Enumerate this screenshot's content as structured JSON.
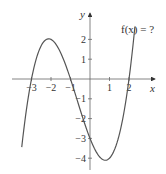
{
  "chart_data": {
    "type": "line",
    "title": "",
    "function_label": "f(x) = ?",
    "xlabel": "x",
    "ylabel": "y",
    "xlim": [
      -3.5,
      2.3
    ],
    "ylim": [
      -4.5,
      3
    ],
    "x_ticks": [
      -3,
      -2,
      -1,
      1,
      2
    ],
    "x_tick_labels": [
      "−3",
      "−2",
      "−1",
      "1",
      "2"
    ],
    "y_ticks": [
      2,
      1,
      -1,
      -2,
      -3,
      -4
    ],
    "y_tick_labels": [
      "2",
      "1",
      "−1",
      "−2",
      "−3",
      "−4"
    ],
    "grid": false,
    "series": [
      {
        "name": "f(x)",
        "description": "cubic with roots at -3, -1, 2; local max (-2, 2); y-intercept -3; local min near (0.9, -4.1)",
        "x": [
          -3.5,
          -3.25,
          -3,
          -2.75,
          -2.5,
          -2.25,
          -2,
          -1.75,
          -1.5,
          -1.25,
          -1,
          -0.75,
          -0.5,
          -0.25,
          0,
          0.25,
          0.5,
          0.75,
          0.88,
          1,
          1.25,
          1.5,
          1.75,
          2,
          2.15,
          2.3
        ],
        "y": [
          -3.38,
          -1.57,
          0,
          1.01,
          1.69,
          1.98,
          2,
          1.82,
          1.31,
          0.6,
          0,
          -0.77,
          -1.56,
          -2.33,
          -3,
          -3.55,
          -3.94,
          -4.14,
          -4.16,
          -4,
          -3.5,
          -2.53,
          -1.09,
          0,
          0.77,
          1.63
        ]
      }
    ],
    "color": "#555555"
  }
}
